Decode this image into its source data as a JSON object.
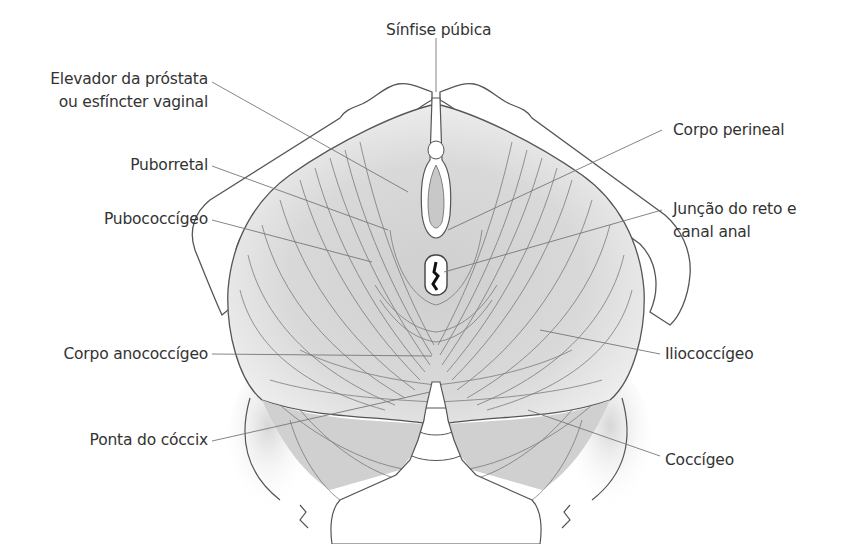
{
  "diagram": {
    "colors": {
      "outline": "#555555",
      "leader": "#777777",
      "muscle_shade": "#bdbdbd",
      "text": "#333333"
    },
    "labels": {
      "sinfise": "Sínfise púbica",
      "elevador_1": "Elevador da próstata",
      "elevador_2": "ou esfíncter vaginal",
      "puborretal": "Puborretal",
      "pubococcigeo": "Pubococcígeo",
      "corpo_perineal": "Corpo perineal",
      "juncao_1": "Junção do reto e",
      "juncao_2": "canal anal",
      "corpo_anococcigeo": "Corpo anococcígeo",
      "iliococcigeo": "Iliococcígeo",
      "ponta_coccix": "Ponta do cóccix",
      "coccigeo": "Coccígeo"
    }
  }
}
